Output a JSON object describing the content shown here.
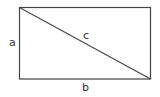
{
  "diagram": {
    "title": "",
    "shape": "rectangle-with-diagonal",
    "labels": {
      "a": "a",
      "b": "b",
      "c": "c"
    },
    "colors": {
      "stroke": "#333333",
      "background": "#ffffff"
    }
  }
}
